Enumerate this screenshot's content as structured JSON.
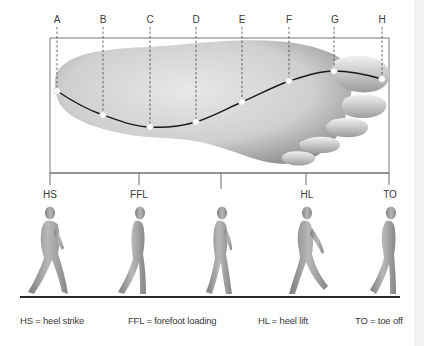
{
  "diagram": {
    "title": "",
    "points": [
      {
        "label": "A",
        "x": 57,
        "y": 91
      },
      {
        "label": "B",
        "x": 103,
        "y": 115
      },
      {
        "label": "C",
        "x": 150,
        "y": 127
      },
      {
        "label": "D",
        "x": 196,
        "y": 122
      },
      {
        "label": "E",
        "x": 242,
        "y": 102
      },
      {
        "label": "F",
        "x": 289,
        "y": 81
      },
      {
        "label": "G",
        "x": 334,
        "y": 71
      },
      {
        "label": "H",
        "x": 382,
        "y": 79
      }
    ],
    "phases": [
      {
        "label": "HS",
        "x": 50
      },
      {
        "label": "FFL",
        "x": 139
      },
      {
        "label": "",
        "x": 221
      },
      {
        "label": "HL",
        "x": 306
      },
      {
        "label": "TO",
        "x": 389
      }
    ],
    "legend": [
      {
        "text": "HS = heel strike",
        "x": 20
      },
      {
        "text": "FFL = forefoot loading",
        "x": 128
      },
      {
        "text": "HL = heel lift",
        "x": 258
      },
      {
        "text": "TO = toe off",
        "x": 355
      }
    ],
    "colors": {
      "line": "#1a1a1a",
      "box": "#7a7a7a",
      "foot_light": "#e6e6e6",
      "foot_dark": "#8f8f8f",
      "figure": "#9a9a9a"
    }
  }
}
